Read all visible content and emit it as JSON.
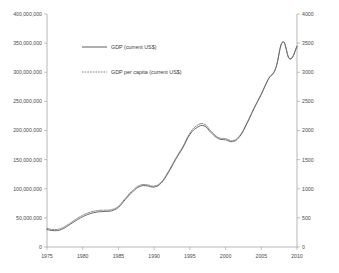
{
  "chart_data": {
    "type": "line",
    "title": "",
    "subtitle": "",
    "xlabel": "",
    "ylabel": "",
    "y2label": "",
    "grid": false,
    "legend_position": "top-center-inside",
    "x": [
      1975,
      1976,
      1977,
      1978,
      1979,
      1980,
      1981,
      1982,
      1983,
      1984,
      1985,
      1986,
      1987,
      1988,
      1989,
      1990,
      1991,
      1992,
      1993,
      1994,
      1995,
      1996,
      1997,
      1998,
      1999,
      2000,
      2001,
      2002,
      2003,
      2004,
      2005,
      2006,
      2007,
      2008,
      2009,
      2010
    ],
    "xticklabels": [
      "1975",
      "1980",
      "1985",
      "1990",
      "1995",
      "2000",
      "2005",
      "2010"
    ],
    "xticks": [
      1975,
      1980,
      1985,
      1990,
      1995,
      2000,
      2005,
      2010
    ],
    "xlim": [
      1975,
      2010
    ],
    "yticklabels": [
      "0",
      "50,000,000",
      "100,000,000",
      "150,000,000",
      "200,000,000",
      "250,000,000",
      "300,000,000",
      "350,000,000",
      "400,000,000"
    ],
    "yticks": [
      0,
      50000000,
      100000000,
      150000000,
      200000000,
      250000000,
      300000000,
      350000000,
      400000000
    ],
    "ylim": [
      0,
      400000000
    ],
    "y2ticklabels": [
      "0",
      "500",
      "1000",
      "1500",
      "2000",
      "2500",
      "3000",
      "3500",
      "4000"
    ],
    "y2ticks": [
      0,
      500,
      1000,
      1500,
      2000,
      2500,
      3000,
      3500,
      4000
    ],
    "y2lim": [
      0,
      4000
    ],
    "series": [
      {
        "name": "GDP (current US$)",
        "axis": "left",
        "style": "solid",
        "color": "#4d4d4d",
        "values": [
          30000000,
          28000000,
          30000000,
          37000000,
          45000000,
          52000000,
          57000000,
          60000000,
          61000000,
          62000000,
          68000000,
          82000000,
          95000000,
          104000000,
          105000000,
          103000000,
          110000000,
          128000000,
          150000000,
          170000000,
          193000000,
          205000000,
          208000000,
          196000000,
          186000000,
          184000000,
          181000000,
          190000000,
          212000000,
          238000000,
          262000000,
          288000000,
          306000000,
          352000000,
          323000000,
          345000000
        ]
      },
      {
        "name": "GDP per capita (current US$)",
        "axis": "right",
        "style": "dashed",
        "color": "#6a6a6a",
        "values": [
          320,
          300,
          322,
          392,
          474,
          545,
          595,
          624,
          633,
          641,
          700,
          842,
          972,
          1060,
          1068,
          1046,
          1116,
          1296,
          1518,
          1720,
          1955,
          2085,
          2110,
          1985,
          1880,
          1860,
          1826,
          1915,
          2135,
          2390,
          2630,
          2888,
          3065,
          3520,
          3225,
          3440
        ]
      }
    ],
    "legend": [
      {
        "label": "GDP (current US$)",
        "style": "solid"
      },
      {
        "label": "GDP per capita (current US$)",
        "style": "dashed"
      }
    ]
  }
}
